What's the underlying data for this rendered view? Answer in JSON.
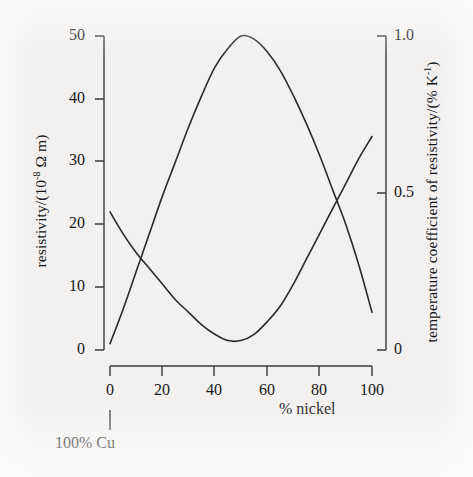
{
  "chart_data": {
    "type": "line",
    "title": "",
    "xlabel": "% nickel",
    "xlim": [
      0,
      100
    ],
    "x_ticks": [
      "0",
      "20",
      "40",
      "60",
      "80",
      "100"
    ],
    "x_tick_values": [
      0,
      20,
      40,
      60,
      80,
      100
    ],
    "grid": false,
    "legend": "none",
    "annotations": [
      {
        "text": "100% Cu",
        "points_to_x": 0,
        "note": "leader line from below x-axis up to the 0 % nickel tick"
      }
    ],
    "axes": [
      {
        "id": "left",
        "label_plain": "resistivity/(10-8 ohm m)",
        "label_prefix": "resistivity/(10",
        "label_exponent": "-8",
        "label_suffix": " Ω m)",
        "ticks": [
          "0",
          "10",
          "20",
          "30",
          "40",
          "50"
        ],
        "tick_values": [
          0,
          10,
          20,
          30,
          40,
          50
        ],
        "ylim": [
          0,
          50
        ]
      },
      {
        "id": "right",
        "label_plain": "temperature coefficient of resistivity/(% K-1)",
        "label_prefix": "temperature coefficient of resistivity/(% K",
        "label_exponent": "-1",
        "label_suffix": ")",
        "ticks": [
          "0",
          "0.5",
          "1.0"
        ],
        "tick_values": [
          0,
          0.5,
          1.0
        ],
        "ylim": [
          0,
          1.0
        ]
      }
    ],
    "series": [
      {
        "name": "resistivity",
        "axis": "left",
        "units": "10^-8 ohm m",
        "x": [
          0,
          5,
          10,
          15,
          20,
          25,
          30,
          35,
          40,
          45,
          50,
          55,
          60,
          65,
          70,
          75,
          80,
          85,
          90,
          95,
          100
        ],
        "values": [
          1.0,
          6.5,
          12.5,
          18.5,
          24.5,
          30.0,
          35.5,
          40.5,
          45.0,
          48.0,
          50.0,
          49.5,
          47.5,
          44.5,
          40.5,
          36.0,
          31.0,
          25.5,
          20.0,
          13.5,
          6.0
        ]
      },
      {
        "name": "temperature coefficient of resistivity",
        "axis": "right",
        "units": "% K^-1",
        "x": [
          0,
          5,
          10,
          15,
          20,
          25,
          30,
          35,
          40,
          45,
          50,
          55,
          60,
          65,
          70,
          75,
          80,
          85,
          90,
          95,
          100
        ],
        "values": [
          0.44,
          0.37,
          0.31,
          0.26,
          0.21,
          0.16,
          0.12,
          0.08,
          0.05,
          0.03,
          0.03,
          0.05,
          0.09,
          0.14,
          0.21,
          0.29,
          0.37,
          0.45,
          0.53,
          0.61,
          0.68
        ]
      }
    ]
  },
  "labels": {
    "x_axis_name": "% nickel",
    "cu_annotation": "100% Cu"
  },
  "colors": {
    "background": "#f2f1ef",
    "ink": "#2a2a2d",
    "text": "#17171a"
  }
}
